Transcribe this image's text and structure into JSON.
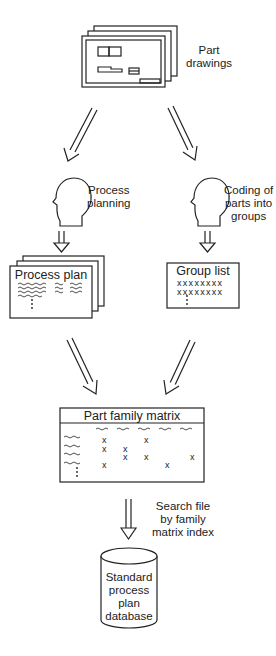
{
  "nodes": {
    "part_drawings": {
      "label_lines": [
        "Part",
        "drawings"
      ]
    },
    "process_planning": {
      "label_lines": [
        "Process",
        "planning"
      ]
    },
    "coding": {
      "label_lines": [
        "Coding of",
        "parts into",
        "groups"
      ]
    },
    "process_plan": {
      "title": "Process plan"
    },
    "group_list": {
      "title": "Group list",
      "rows": [
        "xxxxxxxx",
        "xxxxxxxx"
      ]
    },
    "part_family_matrix": {
      "title": "Part family matrix",
      "marks": [
        {
          "row": 0,
          "col": 0
        },
        {
          "row": 0,
          "col": 2
        },
        {
          "row": 1,
          "col": 0
        },
        {
          "row": 1,
          "col": 1
        },
        {
          "row": 2,
          "col": 1
        },
        {
          "row": 2,
          "col": 2
        },
        {
          "row": 2,
          "col": 4
        },
        {
          "row": 3,
          "col": 0
        },
        {
          "row": 3,
          "col": 3
        }
      ]
    },
    "search_step": {
      "label_lines": [
        "Search file",
        "by family",
        "matrix index"
      ]
    },
    "database": {
      "label_lines": [
        "Standard",
        "process",
        "plan",
        "database"
      ]
    }
  },
  "edges": [
    {
      "from": "part_drawings",
      "to": "process_planning"
    },
    {
      "from": "part_drawings",
      "to": "coding"
    },
    {
      "from": "process_planning",
      "to": "process_plan"
    },
    {
      "from": "coding",
      "to": "group_list"
    },
    {
      "from": "process_plan",
      "to": "part_family_matrix"
    },
    {
      "from": "group_list",
      "to": "part_family_matrix"
    },
    {
      "from": "part_family_matrix",
      "to": "database",
      "label": "Search file by family matrix index"
    }
  ],
  "colors": {
    "stroke": "#222222",
    "background": "#ffffff"
  }
}
